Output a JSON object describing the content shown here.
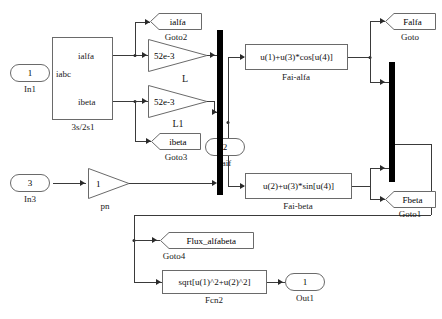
{
  "diagram": {
    "type": "simulink-block-diagram"
  },
  "inputs": [
    {
      "id": "in1",
      "port_number": "1",
      "label": "In1"
    },
    {
      "id": "in2",
      "port_number": "2",
      "label": "faif"
    },
    {
      "id": "in3",
      "port_number": "3",
      "label": "In3"
    }
  ],
  "outputs": [
    {
      "id": "out1",
      "port_number": "1",
      "label": "Out1"
    }
  ],
  "subsystem": {
    "name": "3s/2s1",
    "input_port": "iabc",
    "output_ports": [
      "ialfa",
      "ibeta"
    ]
  },
  "gains": [
    {
      "id": "gain_L",
      "value": "52e-3",
      "label": "L"
    },
    {
      "id": "gain_L1",
      "value": "52e-3",
      "label": "L1"
    },
    {
      "id": "gain_pn",
      "value": "1",
      "label": "pn"
    }
  ],
  "fcn_blocks": [
    {
      "id": "fai_alfa",
      "expr_a": "u(1)+u(3)",
      "expr_star": "*",
      "expr_b": "cos[u(4)]",
      "expr": "u(1)+u(3)*cos[u(4)]",
      "label": "Fai-alfa"
    },
    {
      "id": "fai_beta",
      "expr": "u(2)+u(3)*sin[u(4)]",
      "label": "Fai-beta"
    },
    {
      "id": "fcn2",
      "expr": "sqrt[u(1)^2+u(2)^2]",
      "label": "Fcn2"
    }
  ],
  "goto_tags": [
    {
      "id": "goto2",
      "tag": "ialfa",
      "label": "Goto2"
    },
    {
      "id": "goto3",
      "tag": "ibeta",
      "label": "Goto3"
    },
    {
      "id": "goto",
      "tag": "Falfa",
      "label": "Goto"
    },
    {
      "id": "goto1",
      "tag": "Fbeta",
      "label": "Goto1"
    },
    {
      "id": "goto4",
      "tag": "Flux_alfabeta",
      "label": "Goto4"
    }
  ],
  "colors": {
    "background": "#ffffff",
    "wire": "#3a3a3a",
    "block_border": "#6a6a6a",
    "mux": "#000000",
    "text": "#111111"
  }
}
